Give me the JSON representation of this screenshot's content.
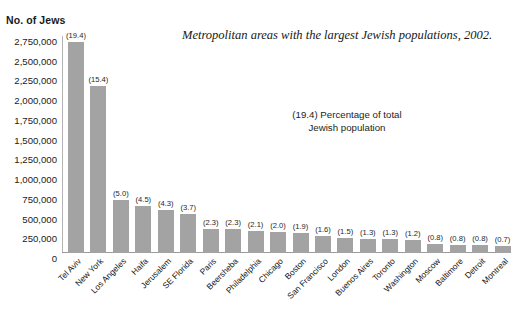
{
  "chart_data": {
    "type": "bar",
    "title": "Metropolitan areas with the largest Jewish populations, 2002.",
    "ylabel": "No. of Jews",
    "xlabel": "",
    "ylim": [
      0,
      2750000
    ],
    "ytick_labels": [
      "2,750,000",
      "2,500,000",
      "2,250,000",
      "2,000,000",
      "1,750,000",
      "1,500,000",
      "1,250,000",
      "1,000,000",
      "750,000",
      "500,000",
      "250,000",
      "0"
    ],
    "ytick_values": [
      2750000,
      2500000,
      2250000,
      2000000,
      1750000,
      1500000,
      1250000,
      1000000,
      750000,
      500000,
      250000,
      0
    ],
    "grid": false,
    "legend_position": "none",
    "annotation": {
      "line1": "(19.4) Percentage of total",
      "line2": "Jewish population"
    },
    "bar_color": "#a3a3a3",
    "categories": [
      "Tel Aviv",
      "New York",
      "Los Angeles",
      "Haifa",
      "Jerusalem",
      "SE Florida",
      "Paris",
      "Beersheba",
      "Philadelphia",
      "Chicago",
      "Boston",
      "San Francisco",
      "London",
      "Buenos Aires",
      "Toronto",
      "Washington",
      "Moscow",
      "Baltimore",
      "Detroit",
      "Montreal"
    ],
    "values": [
      2668000,
      2119000,
      668000,
      590000,
      550000,
      498000,
      310000,
      310000,
      285000,
      265000,
      254000,
      210000,
      195000,
      180000,
      175000,
      165000,
      110000,
      106000,
      103000,
      93000
    ],
    "percent_labels": [
      "(19.4)",
      "(15.4)",
      "(5.0)",
      "(4.5)",
      "(4.3)",
      "(3.7)",
      "(2.3)",
      "(2.3)",
      "(2.1)",
      "(2.0)",
      "(1.9)",
      "(1.6)",
      "(1.5)",
      "(1.3)",
      "(1.3)",
      "(1.2)",
      "(0.8)",
      "(0.8)",
      "(0.8)",
      "(0.7)"
    ],
    "percent_values": [
      19.4,
      15.4,
      5.0,
      4.5,
      4.3,
      3.7,
      2.3,
      2.3,
      2.1,
      2.0,
      1.9,
      1.6,
      1.5,
      1.3,
      1.3,
      1.2,
      0.8,
      0.8,
      0.8,
      0.7
    ]
  }
}
